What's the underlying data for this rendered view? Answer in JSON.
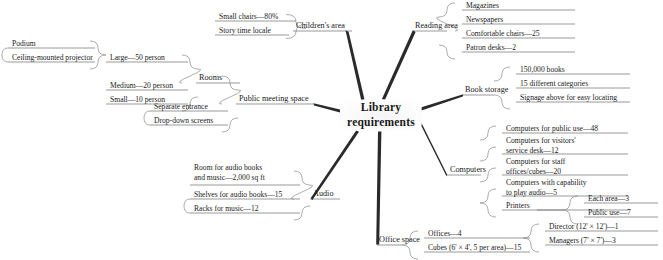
{
  "diagram": {
    "type": "mind-map",
    "center": {
      "line1": "Library",
      "line2": "requirements"
    },
    "branches": [
      {
        "id": "childrens-area",
        "label": "Children's area",
        "leaves": [
          "Small chairs—80%",
          "Story time locale"
        ]
      },
      {
        "id": "reading-area",
        "label": "Reading area",
        "leaves": [
          "Magazines",
          "Newspapers",
          "Comfortable chairs—25",
          "Patron desks—2"
        ]
      },
      {
        "id": "public-meeting-space",
        "label": "Public meeting space",
        "leaves": [
          "Rooms",
          "Separate entrance",
          "Drop-down screens"
        ],
        "sub": [
          {
            "id": "rooms",
            "label": "Rooms",
            "leaves": [
              "Large—50 person",
              "Medium—20 person",
              "Small—10 person"
            ],
            "sub": [
              {
                "id": "large-room",
                "label": "Large—50 person",
                "leaves": [
                  "Podium",
                  "Ceiling-mounted projector"
                ]
              }
            ]
          }
        ]
      },
      {
        "id": "book-storage",
        "label": "Book storage",
        "leaves": [
          "150,000 books",
          "15 different categories",
          "Signage above for easy locating"
        ]
      },
      {
        "id": "computers",
        "label": "Computers",
        "leaves": [
          "Computers for public use—48",
          "Computers for visitors' service desk—12",
          "Computers for staff offices/cubes—20",
          "Computers with capability to play audio—5",
          "Printers"
        ],
        "sub": [
          {
            "id": "printers",
            "label": "Printers",
            "leaves": [
              "Each area—3",
              "Public use—7"
            ]
          }
        ]
      },
      {
        "id": "audio",
        "label": "Audio",
        "leaves": [
          "Room for audio books and music—2,000 sq ft",
          "Shelves for audio books—15",
          "Racks for music—12"
        ]
      },
      {
        "id": "office-space",
        "label": "Office space",
        "leaves": [
          "Offices—4",
          "Cubes (6' × 4', 5 per area)—15"
        ],
        "sub": [
          {
            "id": "offices",
            "label": "Offices—4",
            "leaves": [
              "Director (12' × 12')—1",
              "Managers (7' × 7')—3"
            ]
          }
        ]
      }
    ],
    "leaf_text": {
      "small_chairs": "Small chairs—80%",
      "story_time": "Story time locale",
      "childrens_area": "Children's area",
      "magazines": "Magazines",
      "newspapers": "Newspapers",
      "comfortable_chairs": "Comfortable chairs—25",
      "patron_desks": "Patron desks—2",
      "reading_area": "Reading area",
      "podium": "Podium",
      "projector": "Ceiling-mounted projector",
      "large_room": "Large—50 person",
      "medium_room": "Medium—20 person",
      "small_room": "Small—10 person",
      "rooms": "Rooms",
      "separate_entrance": "Separate entrance",
      "dropdown_screens": "Drop-down screens",
      "public_meeting_space": "Public meeting space",
      "books_count": "150,000 books",
      "categories": "15 different categories",
      "signage": "Signage above for easy locating",
      "book_storage": "Book storage",
      "comp_public_1": "Computers for public use—48",
      "comp_visitors_1": "Computers for visitors'",
      "comp_visitors_2": "service desk—12",
      "comp_staff_1": "Computers for staff",
      "comp_staff_2": "offices/cubes—20",
      "comp_audio_1": "Computers with capability",
      "comp_audio_2": "to play audio—5",
      "printers": "Printers",
      "each_area": "Each area—3",
      "public_use": "Public use—7",
      "computers": "Computers",
      "audio_room_1": "Room for audio books",
      "audio_room_2": "and music—2,000 sq ft",
      "audio_shelves": "Shelves for audio books—15",
      "audio_racks": "Racks for music—12",
      "audio": "Audio",
      "offices": "Offices—4",
      "cubes": "Cubes (6' × 4', 5 per area)—15",
      "director": "Director (12' × 12')—1",
      "managers": "Managers (7' × 7')—3",
      "office_space": "Office space"
    },
    "colors": {
      "ink": "#1a1a1a",
      "line": "#6f6f72",
      "trunk": "#2a2a2d"
    }
  }
}
